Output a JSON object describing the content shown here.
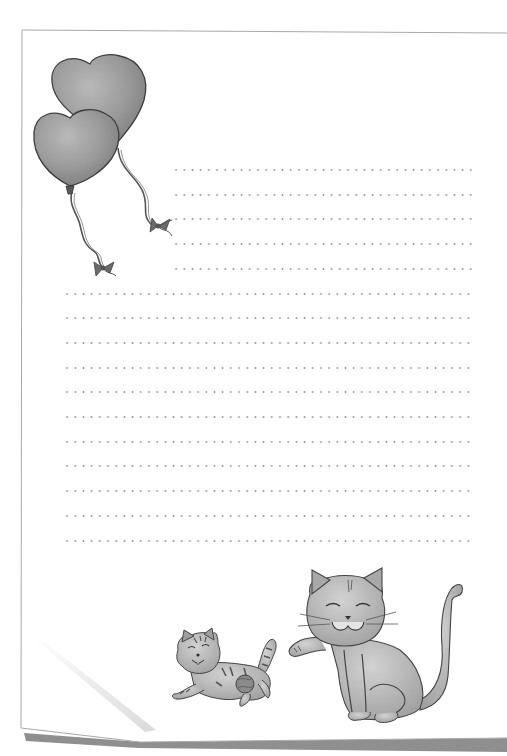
{
  "page": {
    "type": "lined stationery sheet",
    "paper_color": "#ffffff",
    "border_color": "#a8a8a8",
    "shadow_color": "#8f8f8f",
    "fold_highlight_color": "#dcdcdc",
    "text": []
  },
  "writing_lines": {
    "style": "dotted",
    "dot_color": "#9a9a9a",
    "short_lines_count": 5,
    "long_lines_count": 11,
    "total_lines": 16
  },
  "illustrations": [
    {
      "name": "heart-balloon-back",
      "subject": "heart-shaped balloon with ribbon string and bow",
      "tone": "grey watercolor"
    },
    {
      "name": "heart-balloon-front",
      "subject": "heart-shaped balloon with ribbon string and bow",
      "tone": "grey watercolor"
    },
    {
      "name": "kitten-playing",
      "subject": "striped kitten running with a ball of yarn",
      "tone": "grey watercolor"
    },
    {
      "name": "cat-sitting",
      "subject": "smiling cat sitting with raised paw and curled tail",
      "tone": "grey watercolor"
    }
  ]
}
